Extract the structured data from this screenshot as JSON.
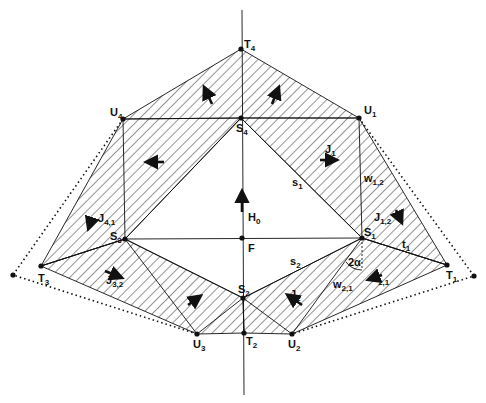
{
  "colors": {
    "ink": "#111111",
    "background": "#ffffff"
  },
  "points": {
    "T4": {
      "label": "T",
      "sub": "4"
    },
    "U4": {
      "label": "U",
      "sub": "4"
    },
    "U1": {
      "label": "U",
      "sub": "1"
    },
    "S4": {
      "label": "S",
      "sub": "4"
    },
    "S3": {
      "label": "S",
      "sub": "3"
    },
    "S1": {
      "label": "S",
      "sub": "1"
    },
    "F": {
      "label": "F",
      "sub": ""
    },
    "T3": {
      "label": "T",
      "sub": "3"
    },
    "T1": {
      "label": "T",
      "sub": "1"
    },
    "S2": {
      "label": "S",
      "sub": "2"
    },
    "T2": {
      "label": "T",
      "sub": "2"
    },
    "U3": {
      "label": "U",
      "sub": "3"
    },
    "U2": {
      "label": "U",
      "sub": "2"
    }
  },
  "labels": {
    "J1": {
      "label": "J",
      "sub": "1"
    },
    "J2": {
      "label": "J",
      "sub": "2"
    },
    "J12": {
      "label": "J",
      "sub": "1,2"
    },
    "J21": {
      "label": "J",
      "sub": "2,1"
    },
    "J32": {
      "label": "J",
      "sub": "3,2"
    },
    "J41": {
      "label": "J",
      "sub": "4,1"
    },
    "s1": {
      "label": "s",
      "sub": "1"
    },
    "s2": {
      "label": "s",
      "sub": "2"
    },
    "t1": {
      "label": "t",
      "sub": "1"
    },
    "w12": {
      "label": "w",
      "sub": "1,2"
    },
    "w21": {
      "label": "w",
      "sub": "2,1"
    },
    "H0": {
      "label": "H",
      "sub": "0"
    },
    "angle": {
      "label": "2α"
    }
  }
}
